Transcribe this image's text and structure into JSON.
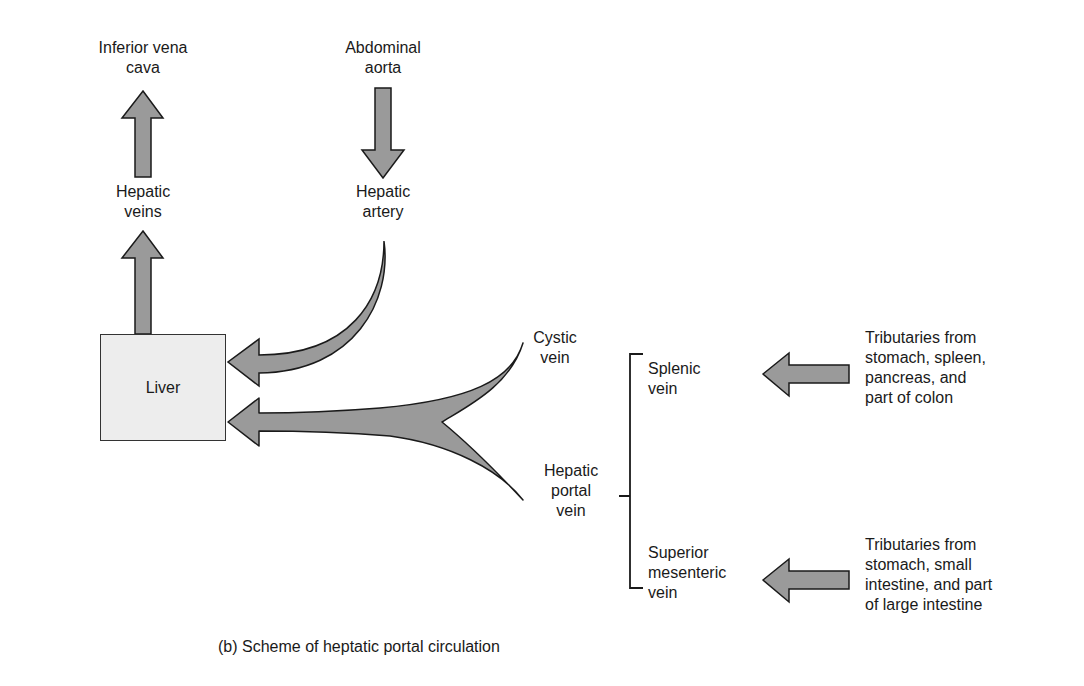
{
  "diagram": {
    "title": "(b) Scheme of heptatic portal circulation",
    "colors": {
      "arrow_fill": "#9a9a9a",
      "arrow_stroke": "#1a1a1a",
      "liver_fill": "#ededed",
      "text": "#1a1a1a",
      "background": "#ffffff"
    },
    "nodes": {
      "inferior_vena_cava": "Inferior vena\ncava",
      "abdominal_aorta": "Abdominal\naorta",
      "hepatic_veins": "Hepatic\nveins",
      "hepatic_artery": "Hepatic\nartery",
      "liver": "Liver",
      "cystic_vein": "Cystic\nvein",
      "hepatic_portal_vein": "Hepatic\nportal\nvein",
      "splenic_vein": "Splenic\nvein",
      "superior_mesenteric_vein": "Superior\nmesenteric\nvein",
      "tributaries_splenic": "Tributaries from\nstomach, spleen,\npancreas, and\npart of colon",
      "tributaries_mesenteric": "Tributaries from\nstomach, small\nintestine, and part\nof large intestine"
    },
    "edges": [
      {
        "from": "Liver",
        "to": "Hepatic veins",
        "direction": "up"
      },
      {
        "from": "Hepatic veins",
        "to": "Inferior vena cava",
        "direction": "up"
      },
      {
        "from": "Abdominal aorta",
        "to": "Hepatic artery",
        "direction": "down"
      },
      {
        "from": "Hepatic artery",
        "to": "Liver",
        "direction": "curved-left"
      },
      {
        "from": "Cystic vein",
        "to": "Liver",
        "direction": "merged-left"
      },
      {
        "from": "Hepatic portal vein",
        "to": "Liver",
        "direction": "merged-left"
      },
      {
        "from": "Tributaries (stomach, spleen, pancreas, colon)",
        "to": "Splenic vein",
        "direction": "left"
      },
      {
        "from": "Tributaries (stomach, small intestine, large intestine)",
        "to": "Superior mesenteric vein",
        "direction": "left"
      }
    ],
    "bracket": {
      "groups": [
        "Splenic vein",
        "Superior mesenteric vein"
      ],
      "joins_into": "Hepatic portal vein"
    }
  }
}
